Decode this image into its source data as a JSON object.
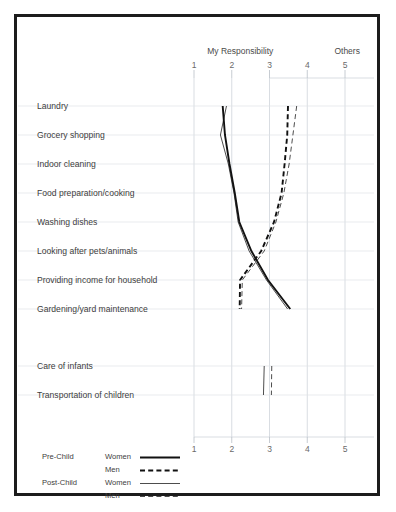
{
  "figure": {
    "left_axis_caption": "My Responsibility",
    "right_axis_caption": "Others",
    "tick_labels": [
      "1",
      "2",
      "3",
      "4",
      "5"
    ],
    "tick_values": [
      1,
      2,
      3,
      4,
      5
    ]
  },
  "legend": {
    "groups": [
      {
        "name": "Pre-Child",
        "rows": [
          {
            "label": "Women",
            "style": "thick-solid"
          },
          {
            "label": "Men",
            "style": "thick-dashed"
          }
        ]
      },
      {
        "name": "Post-Child",
        "rows": [
          {
            "label": "Women",
            "style": "thin-solid"
          },
          {
            "label": "Men",
            "style": "thin-dashed"
          }
        ]
      }
    ]
  },
  "chart_data": {
    "type": "line",
    "title": "",
    "subtitle": "",
    "xlabel": "",
    "ylabel": "",
    "xlim": [
      1,
      5
    ],
    "grid": true,
    "legend_position": "bottom-left",
    "orientation": "horizontal-categories",
    "annotations": [
      "My Responsibility",
      "Others"
    ],
    "categories": [
      "Laundry",
      "Grocery shopping",
      "Indoor cleaning",
      "Food preparation/cooking",
      "Washing dishes",
      "Looking after pets/animals",
      "Providing income for household",
      "Gardening/yard maintenance",
      "Care of infants",
      "Transportation of children"
    ],
    "series": [
      {
        "name": "Pre-Child Women",
        "style": "thick-solid",
        "values": [
          1.76,
          1.82,
          1.94,
          2.08,
          2.2,
          2.52,
          2.96,
          3.55,
          null,
          null
        ]
      },
      {
        "name": "Pre-Child Men",
        "style": "thick-dashed",
        "values": [
          3.49,
          3.47,
          3.4,
          3.32,
          3.12,
          2.78,
          2.22,
          2.21,
          null,
          null
        ]
      },
      {
        "name": "Post-Child Women",
        "style": "thin-solid",
        "values": [
          1.86,
          1.7,
          1.91,
          2.06,
          2.17,
          2.46,
          2.92,
          3.48,
          2.86,
          2.84
        ]
      },
      {
        "name": "Post-Child Men",
        "style": "thin-dashed",
        "values": [
          3.72,
          3.62,
          3.52,
          3.38,
          3.17,
          2.86,
          2.28,
          2.26,
          3.06,
          3.05
        ]
      }
    ]
  }
}
